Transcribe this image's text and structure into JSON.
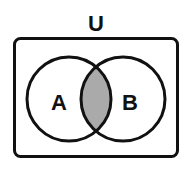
{
  "diagram": {
    "type": "venn",
    "universe_label": "U",
    "sets": [
      {
        "id": "A",
        "label": "A"
      },
      {
        "id": "B",
        "label": "B"
      }
    ],
    "shaded_region": "A ∩ B",
    "colors": {
      "stroke": "#111111",
      "shade": "#aaaaaa",
      "background": "#ffffff"
    }
  }
}
